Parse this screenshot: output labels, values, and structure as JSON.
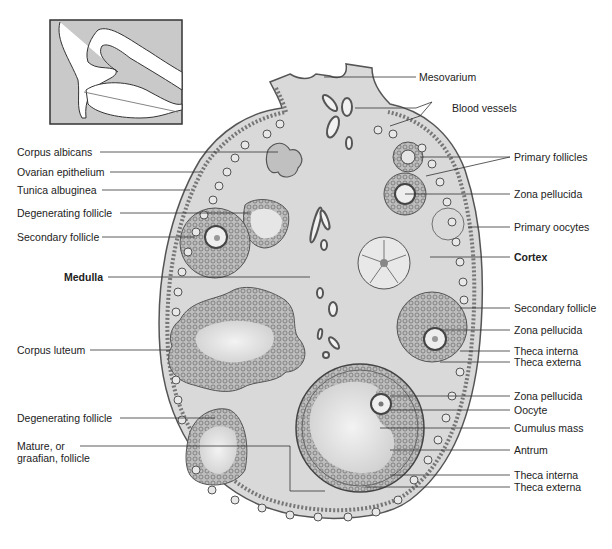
{
  "figure": {
    "colors": {
      "tissue_fill": "#d9d9d9",
      "outline": "#555555",
      "leader_line": "#333333",
      "text": "#222222",
      "inset_bg": "#c9c9c9"
    },
    "inset": {
      "description": "Hand holding ovary (orientation inset)"
    },
    "labels_left": [
      {
        "text": "Corpus albicans",
        "bold": false
      },
      {
        "text": "Ovarian epithelium",
        "bold": false
      },
      {
        "text": "Tunica albuginea",
        "bold": false
      },
      {
        "text": "Degenerating follicle",
        "bold": false
      },
      {
        "text": "Secondary follicle",
        "bold": false
      },
      {
        "text": "Medulla",
        "bold": true
      },
      {
        "text": "Corpus luteum",
        "bold": false
      },
      {
        "text": "Degenerating follicle",
        "bold": false
      },
      {
        "text": "Mature, or graafian, follicle",
        "bold": false
      }
    ],
    "labels_right": [
      {
        "text": "Mesovarium",
        "bold": false
      },
      {
        "text": "Blood vessels",
        "bold": false
      },
      {
        "text": "Primary follicles",
        "bold": false
      },
      {
        "text": "Zona  pellucida",
        "bold": false
      },
      {
        "text": "Primary oocytes",
        "bold": false
      },
      {
        "text": "Cortex",
        "bold": true
      },
      {
        "text": "Secondary follicle",
        "bold": false
      },
      {
        "text": "Zona  pellucida",
        "bold": false
      },
      {
        "text": "Theca interna",
        "bold": false
      },
      {
        "text": "Theca externa",
        "bold": false
      },
      {
        "text": "Zona  pellucida",
        "bold": false
      },
      {
        "text": "Oocyte",
        "bold": false
      },
      {
        "text": "Cumulus mass",
        "bold": false
      },
      {
        "text": "Antrum",
        "bold": false
      },
      {
        "text": "Theca interna",
        "bold": false
      },
      {
        "text": "Theca externa",
        "bold": false
      }
    ]
  }
}
